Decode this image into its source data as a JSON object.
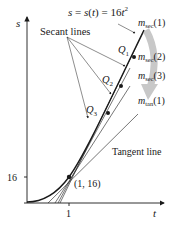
{
  "diagram": {
    "equation": {
      "prefix": "s = s(",
      "var": "t",
      "mid": ") = 16",
      "var2": "t",
      "exp": "2"
    },
    "axes": {
      "y_label": "s",
      "x_label": "t",
      "y_tick": "16",
      "x_tick": "1"
    },
    "point_label": "(1, 16)",
    "secant_lines_label": "Secant lines",
    "tangent_line_label": "Tangent line",
    "points": [
      {
        "name": "Q",
        "sub": "1"
      },
      {
        "name": "Q",
        "sub": "2"
      },
      {
        "name": "Q",
        "sub": "3"
      }
    ],
    "slopes": [
      {
        "m": "m",
        "sub": "sec",
        "arg": "(1)"
      },
      {
        "m": "m",
        "sub": "sec",
        "arg": "(2)"
      },
      {
        "m": "m",
        "sub": "sec",
        "arg": "(3)"
      },
      {
        "m": "m",
        "sub": "tan",
        "arg": "(1)"
      }
    ],
    "colors": {
      "ink": "#1a1a1a",
      "arrow": "#c8c8c8"
    }
  }
}
